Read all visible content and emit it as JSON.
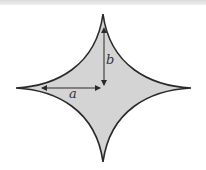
{
  "figure": {
    "shape": "astroid (hypocycloid with four cusps)",
    "fill_color": "#d4d4d4",
    "stroke_color": "#2a2a2a",
    "labels": {
      "horizontal": "a",
      "vertical": "b"
    },
    "center": [
      103,
      88
    ],
    "half_width_a": 87,
    "half_height_b": 74
  }
}
